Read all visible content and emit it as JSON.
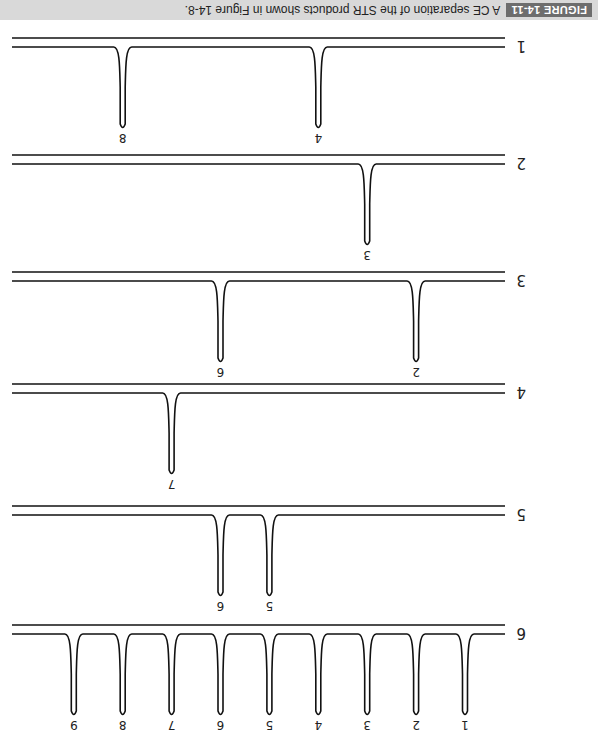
{
  "caption": {
    "label": "FIGURE 14-11",
    "text": "A CE separation of the STR products shown in Figure 14-8."
  },
  "orientation": "rotated 180 degrees",
  "colors": {
    "trace": "#111111",
    "caption_bg": "#d9d9d9",
    "label_bg": "#6d6d6d"
  },
  "lanes": [
    {
      "lane": "6",
      "peaks": [
        "1",
        "2",
        "3",
        "4",
        "5",
        "6",
        "7",
        "8",
        "9"
      ]
    },
    {
      "lane": "5",
      "peaks": [
        "5",
        "6"
      ]
    },
    {
      "lane": "4",
      "peaks": [
        "7"
      ]
    },
    {
      "lane": "3",
      "peaks": [
        "2",
        "6"
      ]
    },
    {
      "lane": "2",
      "peaks": [
        "3"
      ]
    },
    {
      "lane": "1",
      "peaks": [
        "4",
        "8"
      ]
    }
  ],
  "chart_data": {
    "type": "line",
    "title": "A CE separation of the STR products shown in Figure 14-8.",
    "xlabel": "",
    "ylabel": "",
    "series": [
      {
        "name": "6",
        "peak_positions": [
          1,
          2,
          3,
          4,
          5,
          6,
          7,
          8,
          9
        ]
      },
      {
        "name": "5",
        "peak_positions": [
          5,
          6
        ]
      },
      {
        "name": "4",
        "peak_positions": [
          7
        ]
      },
      {
        "name": "3",
        "peak_positions": [
          2,
          6
        ]
      },
      {
        "name": "2",
        "peak_positions": [
          3
        ]
      },
      {
        "name": "1",
        "peak_positions": [
          4,
          8
        ]
      }
    ]
  }
}
